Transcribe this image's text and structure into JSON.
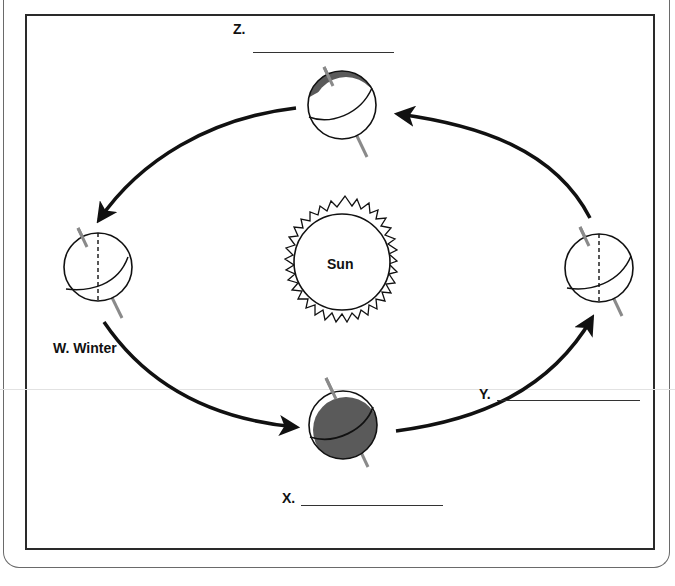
{
  "diagram": {
    "center": {
      "label": "Sun"
    },
    "positions": [
      {
        "id": "W",
        "label": "W. Winter",
        "blank": false,
        "position": "left"
      },
      {
        "id": "X",
        "label": "X.",
        "blank": true,
        "position": "bottom"
      },
      {
        "id": "Y",
        "label": "Y.",
        "blank": true,
        "position": "right"
      },
      {
        "id": "Z",
        "label": "Z.",
        "blank": true,
        "position": "top"
      }
    ],
    "orbit_direction": "counterclockwise",
    "colors": {
      "line": "#111111",
      "shade": "#5a5a5a",
      "axis": "#8a8a8a",
      "frame": "#2a2a2a"
    }
  }
}
